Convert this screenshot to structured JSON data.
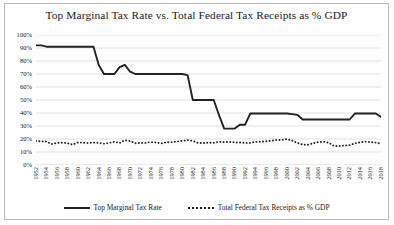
{
  "chart_data": {
    "type": "line",
    "title": "Top Marginal Tax Rate vs. Total Federal Tax Receipts as % GDP",
    "xlabel": "",
    "ylabel": "",
    "ylim": [
      0,
      100
    ],
    "yticks": [
      "0%",
      "10%",
      "20%",
      "30%",
      "40%",
      "50%",
      "60%",
      "70%",
      "80%",
      "90%",
      "100%"
    ],
    "ytick_values": [
      0,
      10,
      20,
      30,
      40,
      50,
      60,
      70,
      80,
      90,
      100
    ],
    "grid": true,
    "legend_position": "bottom",
    "xlim": [
      1952,
      2018
    ],
    "xtick_labels": [
      "1952",
      "1954",
      "1956",
      "1958",
      "1960",
      "1962",
      "1964",
      "1966",
      "1968",
      "1970",
      "1972",
      "1974",
      "1976",
      "1978",
      "1980",
      "1982",
      "1984",
      "1986",
      "1988",
      "1990",
      "1992",
      "1994",
      "1996",
      "1998",
      "2000",
      "2002",
      "2004",
      "2006",
      "2008",
      "2010",
      "2012",
      "2014",
      "2016",
      "2018"
    ],
    "x": [
      1952,
      1953,
      1954,
      1955,
      1956,
      1957,
      1958,
      1959,
      1960,
      1961,
      1962,
      1963,
      1964,
      1965,
      1966,
      1967,
      1968,
      1969,
      1970,
      1971,
      1972,
      1973,
      1974,
      1975,
      1976,
      1977,
      1978,
      1979,
      1980,
      1981,
      1982,
      1983,
      1984,
      1985,
      1986,
      1987,
      1988,
      1989,
      1990,
      1991,
      1992,
      1993,
      1994,
      1995,
      1996,
      1997,
      1998,
      1999,
      2000,
      2001,
      2002,
      2003,
      2004,
      2005,
      2006,
      2007,
      2008,
      2009,
      2010,
      2011,
      2012,
      2013,
      2014,
      2015,
      2016,
      2017,
      2018
    ],
    "series": [
      {
        "name": "Top Marginal Tax Rate",
        "style": "solid",
        "color": "#222222",
        "values": [
          92,
          92,
          91,
          91,
          91,
          91,
          91,
          91,
          91,
          91,
          91,
          91,
          77,
          70,
          70,
          70,
          75.25,
          77,
          71.75,
          70,
          70,
          70,
          70,
          70,
          70,
          70,
          70,
          70,
          70,
          69.125,
          50,
          50,
          50,
          50,
          50,
          38.5,
          28,
          28,
          28,
          31,
          31,
          39.6,
          39.6,
          39.6,
          39.6,
          39.6,
          39.6,
          39.6,
          39.6,
          39.1,
          38.6,
          35,
          35,
          35,
          35,
          35,
          35,
          35,
          35,
          35,
          35,
          39.6,
          39.6,
          39.6,
          39.6,
          39.6,
          37
        ]
      },
      {
        "name": "Total Federal Tax Receipts as % GDP",
        "style": "dotted",
        "color": "#222222",
        "values": [
          18.5,
          18.2,
          18.0,
          16.1,
          17.0,
          17.2,
          16.8,
          15.7,
          17.3,
          17.2,
          17.0,
          17.2,
          17.0,
          16.4,
          17.0,
          17.8,
          17.0,
          19.0,
          18.4,
          16.7,
          17.0,
          17.0,
          17.7,
          17.3,
          16.6,
          17.5,
          17.6,
          18.1,
          18.5,
          19.1,
          18.6,
          17.0,
          16.9,
          17.2,
          17.0,
          17.9,
          17.6,
          17.8,
          17.4,
          17.3,
          17.0,
          17.0,
          17.8,
          17.9,
          18.2,
          18.6,
          19.2,
          19.2,
          20.0,
          18.8,
          17.0,
          15.7,
          15.6,
          16.7,
          17.6,
          17.9,
          17.1,
          14.6,
          14.6,
          15.0,
          15.3,
          16.7,
          17.5,
          18.0,
          17.6,
          17.2,
          16.4
        ]
      }
    ]
  },
  "legend": {
    "items": [
      {
        "label": "Top Marginal Tax Rate",
        "style": "solid"
      },
      {
        "label": "Total Federal Tax Receipts as % GDP",
        "style": "dotted"
      }
    ]
  },
  "colors": {
    "line": "#222222",
    "grid": "#d4d4d4",
    "border": "#b9b9b9",
    "text": "#1a1a1a",
    "background": "#ffffff"
  }
}
